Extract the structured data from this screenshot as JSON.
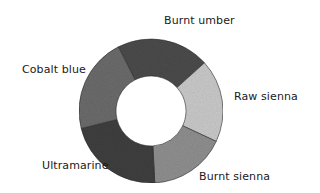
{
  "diagram": {
    "type": "donut",
    "center": [
      151,
      111
    ],
    "outer_radius": 72,
    "inner_radius": 35,
    "segments": [
      {
        "name": "Burnt umber",
        "start_deg": -27,
        "end_deg": 48,
        "color": "#4b4b4b",
        "label_pos": [
          164,
          14
        ]
      },
      {
        "name": "Raw sienna",
        "start_deg": 48,
        "end_deg": 115,
        "color": "#c9c9c9",
        "label_pos": [
          234,
          90
        ]
      },
      {
        "name": "Burnt sienna",
        "start_deg": 115,
        "end_deg": 177,
        "color": "#8f8f8f",
        "label_pos": [
          199,
          170
        ]
      },
      {
        "name": "Ultramarine",
        "start_deg": 177,
        "end_deg": 256,
        "color": "#3f3f3f",
        "label_pos": [
          42,
          159
        ]
      },
      {
        "name": "Cobalt blue",
        "start_deg": 256,
        "end_deg": 333,
        "color": "#6b6b6b",
        "label_pos": [
          22,
          63
        ]
      }
    ]
  },
  "labels": {
    "burnt_umber": "Burnt umber",
    "raw_sienna": "Raw sienna",
    "burnt_sienna": "Burnt sienna",
    "ultramarine": "Ultramarine",
    "cobalt_blue": "Cobalt blue"
  }
}
